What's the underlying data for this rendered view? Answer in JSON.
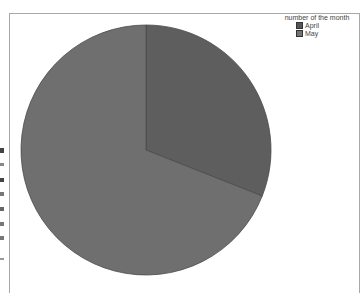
{
  "chart_data": {
    "type": "pie",
    "title": "",
    "legend_title": "number of the month",
    "legend_position": "top-right",
    "categories": [
      "April",
      "May"
    ],
    "values": [
      31,
      69
    ],
    "colors": [
      "#5e5e5e",
      "#6f6f6f"
    ],
    "start_angle_deg": 0,
    "direction": "clockwise"
  },
  "legend": {
    "title": "number of the month",
    "items": [
      {
        "label": "April",
        "color": "#555555"
      },
      {
        "label": "May",
        "color": "#747474"
      }
    ]
  }
}
